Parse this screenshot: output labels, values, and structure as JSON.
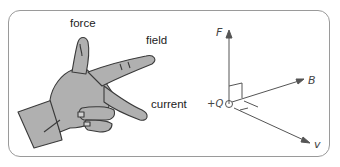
{
  "hand": {
    "force_label": "force",
    "field_label": "field",
    "current_label": "current"
  },
  "axes": {
    "F_label": "F",
    "B_label": "B",
    "v_label": "v",
    "charge_label": "+Q"
  },
  "colors": {
    "hand_fill": "#b0b0b0",
    "hand_stroke": "#3a3a3a",
    "axis_stroke": "#555555",
    "frame_stroke": "#9a9a9a"
  }
}
